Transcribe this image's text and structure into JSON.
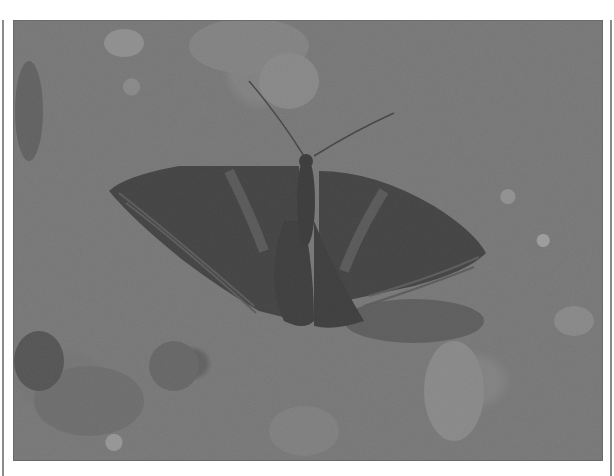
{
  "image": {
    "description": "Grayscale photograph of a dark moth with banded wings resting on gravel and small stones",
    "subject": "moth",
    "background": "gravel ground with pebbles",
    "colors": {
      "page_background": "#ffffff",
      "frame_line": "#8a8a8a",
      "ground": "#7c7c7c",
      "moth_wing": "#1e1e1e",
      "moth_band": "#4a4a4a"
    }
  }
}
